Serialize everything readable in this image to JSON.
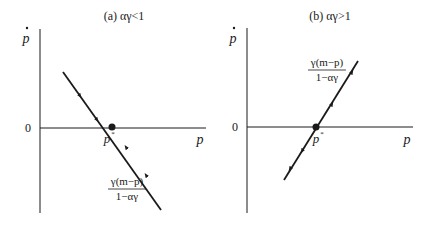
{
  "panels": [
    {
      "id": "a",
      "title": "(a) αγ<1",
      "y_axis_label": "p",
      "x_axis_label": "p",
      "origin_label": "0",
      "equilibrium_label": "p",
      "equilibrium_superscript": "*",
      "line_label_numerator": "γ(m−p)",
      "line_label_denominator": "1−αγ",
      "slope": "negative",
      "stability": "stable"
    },
    {
      "id": "b",
      "title": "(b) αγ>1",
      "y_axis_label": "p",
      "x_axis_label": "p",
      "origin_label": "0",
      "equilibrium_label": "p",
      "equilibrium_superscript": "*",
      "line_label_numerator": "γ(m−p)",
      "line_label_denominator": "1−αγ",
      "slope": "positive",
      "stability": "unstable"
    }
  ],
  "colors": {
    "ink": "#1a1a1a",
    "background": "#ffffff"
  }
}
